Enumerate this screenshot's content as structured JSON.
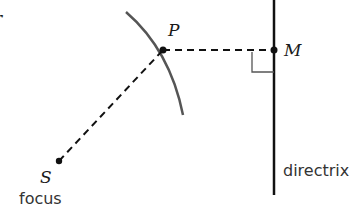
{
  "diagram": {
    "labels": {
      "point_p": "P",
      "point_m": "M",
      "point_s": "S",
      "focus": "focus",
      "directrix": "directrix",
      "edge_fragment": "r"
    },
    "points": {
      "P": [
        163,
        50
      ],
      "M": [
        274,
        50
      ],
      "S": [
        59,
        161
      ]
    },
    "colors": {
      "curve": "#555555",
      "lines": "#111111",
      "text": "#1a1a1a"
    }
  }
}
